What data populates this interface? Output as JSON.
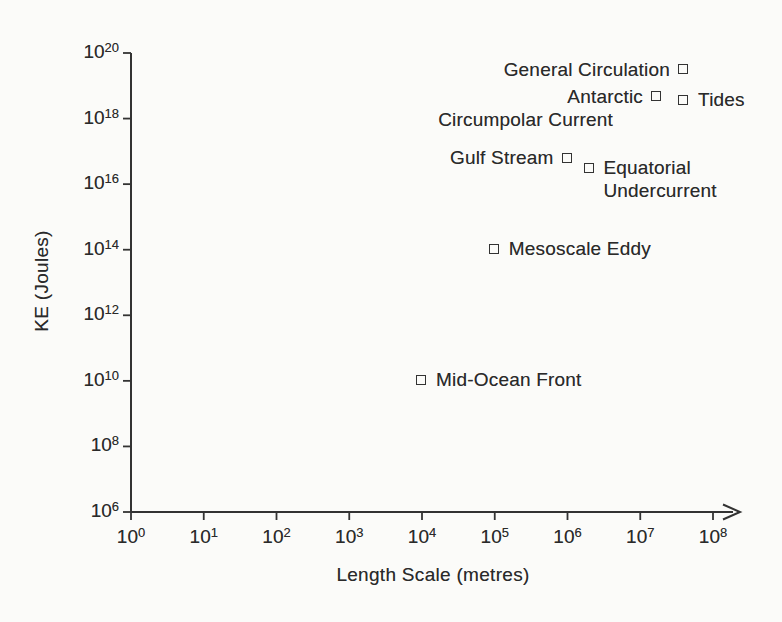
{
  "figure": {
    "background": "#fbfbf9",
    "ink": "#333333"
  },
  "chart_data": {
    "type": "scatter",
    "title": "",
    "xlabel": "Length Scale (metres)",
    "ylabel": "KE (Joules)",
    "x_scale": "log",
    "y_scale": "log",
    "xlim": [
      1,
      100000000
    ],
    "ylim": [
      1000000,
      100000000000000000000
    ],
    "grid": false,
    "marker": "open-square",
    "tick_base": "10",
    "x_tick_exponents": [
      0,
      1,
      2,
      3,
      4,
      5,
      6,
      7,
      8
    ],
    "y_tick_exponents": [
      6,
      8,
      10,
      12,
      14,
      16,
      18,
      20
    ],
    "points": [
      {
        "label": "General Circulation",
        "x": 40000000.0,
        "y": 3e+19,
        "label_side": "left",
        "label_lines": [
          "General Circulation"
        ]
      },
      {
        "label": "Antarctic Circumpolar Current",
        "x": 17000000.0,
        "y": 4.5e+18,
        "label_side": "left",
        "label_lines": [
          "Antarctic",
          "Circumpolar Current"
        ],
        "line_dx": [
          0,
          -30
        ]
      },
      {
        "label": "Tides",
        "x": 40000000.0,
        "y": 3.5e+18,
        "label_side": "right",
        "label_lines": [
          "Tides"
        ]
      },
      {
        "label": "Gulf Stream",
        "x": 1000000.0,
        "y": 6e+16,
        "label_side": "left",
        "label_lines": [
          "Gulf Stream"
        ]
      },
      {
        "label": "Equatorial Undercurrent",
        "x": 2000000.0,
        "y": 3e+16,
        "label_side": "right",
        "label_lines": [
          "Equatorial",
          "Undercurrent"
        ]
      },
      {
        "label": "Mesoscale Eddy",
        "x": 100000.0,
        "y": 100000000000000.0,
        "label_side": "right",
        "label_lines": [
          "Mesoscale Eddy"
        ]
      },
      {
        "label": "Mid-Ocean Front",
        "x": 10000.0,
        "y": 10000000000.0,
        "label_side": "right",
        "label_lines": [
          "Mid-Ocean Front"
        ]
      }
    ]
  }
}
